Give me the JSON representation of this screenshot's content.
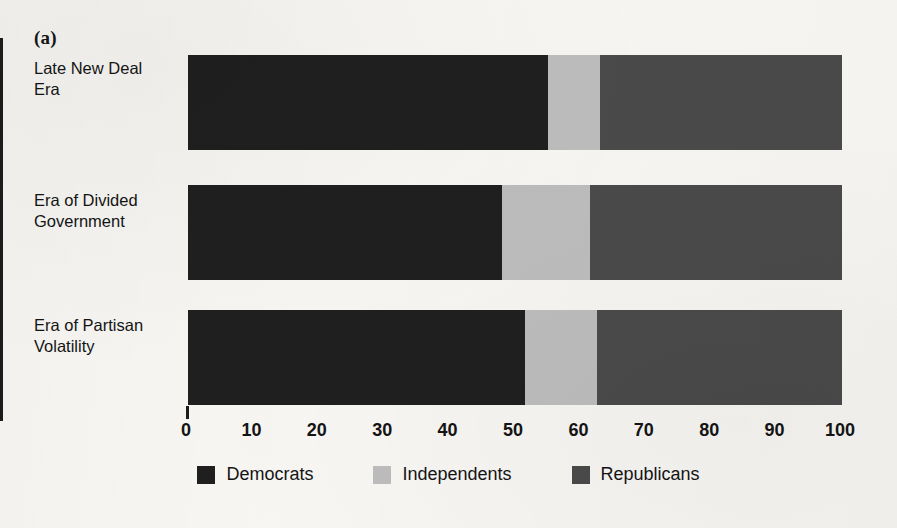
{
  "figure": {
    "panel_label": "(a)"
  },
  "axis": {
    "x_ticks": [
      "0",
      "10",
      "20",
      "30",
      "40",
      "50",
      "60",
      "70",
      "80",
      "90",
      "100"
    ],
    "x_min": 0,
    "x_max": 100
  },
  "legend": {
    "items": [
      {
        "label": "Democrats",
        "color": "#1f1f1f"
      },
      {
        "label": "Independents",
        "color": "#bdbdbd"
      },
      {
        "label": "Republicans",
        "color": "#4a4a4a"
      }
    ]
  },
  "bars": [
    {
      "category_line1": "Late New Deal",
      "category_line2": "Era",
      "democrats": 55,
      "independents": 8,
      "republicans": 37
    },
    {
      "category_line1": "Era of Divided",
      "category_line2": "Government",
      "democrats": 48,
      "independents": 13.5,
      "republicans": 38.5
    },
    {
      "category_line1": "Era of Partisan",
      "category_line2": "Volatility",
      "democrats": 51.5,
      "independents": 11,
      "republicans": 37.5
    }
  ],
  "chart_data": {
    "type": "bar",
    "orientation": "horizontal",
    "stacked": true,
    "title": "",
    "subtitle": "",
    "panel_label": "(a)",
    "xlabel": "",
    "ylabel": "",
    "xlim": [
      0,
      100
    ],
    "xticks": [
      0,
      10,
      20,
      30,
      40,
      50,
      60,
      70,
      80,
      90,
      100
    ],
    "grid": false,
    "legend_position": "bottom",
    "categories": [
      "Late New Deal Era",
      "Era of Divided Government",
      "Era of Partisan Volatility"
    ],
    "series": [
      {
        "name": "Democrats",
        "color": "#1f1f1f",
        "values": [
          55,
          48,
          51.5
        ]
      },
      {
        "name": "Independents",
        "color": "#bdbdbd",
        "values": [
          8,
          13.5,
          11
        ]
      },
      {
        "name": "Republicans",
        "color": "#4a4a4a",
        "values": [
          37,
          38.5,
          37.5
        ]
      }
    ]
  }
}
